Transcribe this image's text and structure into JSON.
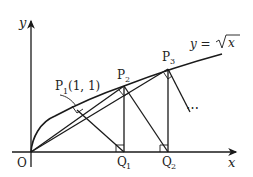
{
  "diagram": {
    "axis_x_label": "x",
    "axis_y_label": "y",
    "origin_label": "O",
    "curve_label_lhs": "y =",
    "curve_label_rad": "x",
    "points": {
      "P1": {
        "name": "P",
        "sub": "1",
        "coords": "(1, 1)"
      },
      "P2": {
        "name": "P",
        "sub": "2"
      },
      "P3": {
        "name": "P",
        "sub": "3"
      },
      "Q1": {
        "name": "Q",
        "sub": "1"
      },
      "Q2": {
        "name": "Q",
        "sub": "2"
      }
    },
    "ellipsis": "⋯",
    "line_color": "#1a1a1a"
  }
}
